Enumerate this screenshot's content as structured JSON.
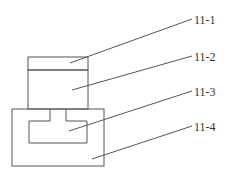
{
  "diagram": {
    "stroke_color": "#555555",
    "labels": [
      {
        "id": "11-1",
        "text": "11-1",
        "x": 194,
        "y": 24,
        "leader": {
          "x1": 192,
          "y1": 19,
          "x2": 70,
          "y2": 63
        }
      },
      {
        "id": "11-2",
        "text": "11-2",
        "x": 194,
        "y": 61,
        "leader": {
          "x1": 192,
          "y1": 56,
          "x2": 72,
          "y2": 90
        }
      },
      {
        "id": "11-3",
        "text": "11-3",
        "x": 194,
        "y": 96,
        "leader": {
          "x1": 192,
          "y1": 91,
          "x2": 69,
          "y2": 131
        }
      },
      {
        "id": "11-4",
        "text": "11-4",
        "x": 194,
        "y": 131,
        "leader": {
          "x1": 192,
          "y1": 126,
          "x2": 92,
          "y2": 159
        }
      }
    ],
    "parts": {
      "top_cap": {
        "x": 28,
        "y": 57,
        "w": 60,
        "h": 13
      },
      "upper_body": {
        "x": 28,
        "y": 70,
        "w": 60,
        "h": 39
      },
      "base_block": {
        "x": 12,
        "y": 109,
        "w": 92,
        "h": 57
      },
      "t_slot": {
        "left": 29,
        "right": 87,
        "top": 121,
        "bottom": 143,
        "stem_left": 50,
        "stem_right": 66
      }
    }
  }
}
